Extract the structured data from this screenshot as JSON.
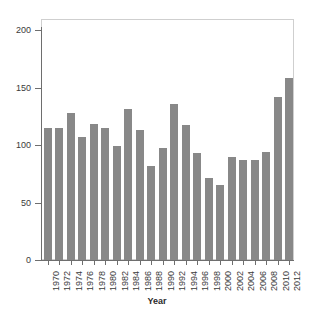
{
  "chart_data": {
    "type": "bar",
    "title": "",
    "xlabel": "Year",
    "ylabel": "",
    "categories": [
      "1970",
      "1972",
      "1974",
      "1976",
      "1978",
      "1980",
      "1982",
      "1984",
      "1986",
      "1988",
      "1990",
      "1992",
      "1994",
      "1996",
      "1998",
      "2000",
      "2002",
      "2004",
      "2006",
      "2008",
      "2010",
      "2012"
    ],
    "values": [
      115,
      115,
      128,
      107,
      118,
      115,
      99,
      131,
      113,
      82,
      97,
      136,
      117,
      93,
      71,
      65,
      90,
      87,
      87,
      94,
      142,
      158
    ],
    "ylim": [
      0,
      200
    ],
    "yticks": [
      0,
      50,
      100,
      150,
      200
    ],
    "ytick_labels": [
      "0",
      "50",
      "100",
      "150",
      "200"
    ],
    "grid": false,
    "legend": false,
    "bar_color": "#888888",
    "frame_color": "#cfcfcf",
    "axis_color": "#6e6e6e"
  },
  "axes": {
    "x_title": "Year"
  }
}
